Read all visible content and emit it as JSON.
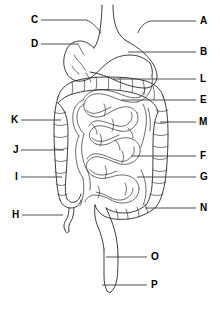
{
  "figure": {
    "background_color": "#ffffff",
    "line_color": "#1a1a1a",
    "label_color": "#000000",
    "leader_color": "#3a3a3a",
    "width": 220,
    "height": 310
  },
  "labels": [
    {
      "id": "A",
      "text": "A",
      "side": "right",
      "x": 200,
      "y": 16,
      "leader_from_x": 196,
      "leader_from_y": 21,
      "leader_to_x": 150,
      "leader_to_y": 21
    },
    {
      "id": "B",
      "text": "B",
      "side": "right",
      "x": 200,
      "y": 47,
      "leader_from_x": 196,
      "leader_from_y": 52,
      "leader_to_x": 128,
      "leader_to_y": 52
    },
    {
      "id": "C",
      "text": "C",
      "side": "left",
      "x": 31,
      "y": 15,
      "leader_from_x": 41,
      "leader_from_y": 20,
      "leader_to_x": 86,
      "leader_to_y": 20
    },
    {
      "id": "D",
      "text": "D",
      "side": "left",
      "x": 31,
      "y": 39,
      "leader_from_x": 41,
      "leader_from_y": 44,
      "leader_to_x": 78,
      "leader_to_y": 44
    },
    {
      "id": "E",
      "text": "E",
      "side": "right",
      "x": 200,
      "y": 95,
      "leader_from_x": 196,
      "leader_from_y": 100,
      "leader_to_x": 121,
      "leader_to_y": 100
    },
    {
      "id": "F",
      "text": "F",
      "side": "right",
      "x": 200,
      "y": 151,
      "leader_from_x": 196,
      "leader_from_y": 156,
      "leader_to_x": 131,
      "leader_to_y": 156
    },
    {
      "id": "G",
      "text": "G",
      "side": "right",
      "x": 200,
      "y": 172,
      "leader_from_x": 196,
      "leader_from_y": 177,
      "leader_to_x": 137,
      "leader_to_y": 177
    },
    {
      "id": "H",
      "text": "H",
      "side": "left",
      "x": 12,
      "y": 210,
      "leader_from_x": 22,
      "leader_from_y": 215,
      "leader_to_x": 63,
      "leader_to_y": 215
    },
    {
      "id": "I",
      "text": "I",
      "side": "left",
      "x": 14,
      "y": 172,
      "leader_from_x": 21,
      "leader_from_y": 177,
      "leader_to_x": 62,
      "leader_to_y": 177
    },
    {
      "id": "J",
      "text": "J",
      "side": "left",
      "x": 13,
      "y": 145,
      "leader_from_x": 21,
      "leader_from_y": 150,
      "leader_to_x": 64,
      "leader_to_y": 150
    },
    {
      "id": "K",
      "text": "K",
      "side": "left",
      "x": 11,
      "y": 115,
      "leader_from_x": 21,
      "leader_from_y": 120,
      "leader_to_x": 61,
      "leader_to_y": 120
    },
    {
      "id": "L",
      "text": "L",
      "side": "right",
      "x": 200,
      "y": 74,
      "leader_from_x": 196,
      "leader_from_y": 79,
      "leader_to_x": 113,
      "leader_to_y": 79
    },
    {
      "id": "M",
      "text": "M",
      "side": "right",
      "x": 199,
      "y": 117,
      "leader_from_x": 196,
      "leader_from_y": 122,
      "leader_to_x": 160,
      "leader_to_y": 122
    },
    {
      "id": "N",
      "text": "N",
      "side": "right",
      "x": 200,
      "y": 203,
      "leader_from_x": 196,
      "leader_from_y": 208,
      "leader_to_x": 145,
      "leader_to_y": 208
    },
    {
      "id": "O",
      "text": "O",
      "side": "right",
      "x": 151,
      "y": 252,
      "leader_from_x": 147,
      "leader_from_y": 257,
      "leader_to_x": 106,
      "leader_to_y": 257
    },
    {
      "id": "P",
      "text": "P",
      "side": "right",
      "x": 151,
      "y": 280,
      "leader_from_x": 147,
      "leader_from_y": 285,
      "leader_to_x": 102,
      "leader_to_y": 285
    }
  ],
  "organs": {
    "esophagus": "esophagus-outline",
    "stomach": "stomach-outline",
    "large_intestine": "large-intestine-outline",
    "small_intestine": "small-intestine-coils",
    "appendix": "appendix-outline",
    "rectum": "rectum-outline"
  }
}
